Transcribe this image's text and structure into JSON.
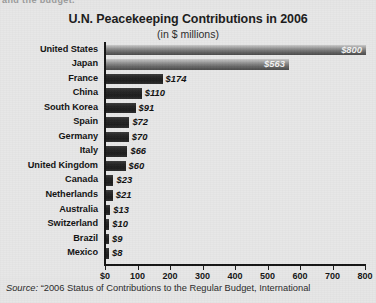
{
  "page": {
    "clipped_top_text": "and the budget."
  },
  "chart": {
    "title": "U.N. Peacekeeping Contributions in 2006",
    "subtitle": "(in $ millions)",
    "source_label": "Source:",
    "source_text": "“2006 Status of Contributions to the Regular Budget, International"
  },
  "chart_data": {
    "type": "bar",
    "orientation": "horizontal",
    "title": "U.N. Peacekeeping Contributions in 2006",
    "subtitle": "(in $ millions)",
    "xlabel": "",
    "ylabel": "",
    "xlim": [
      0,
      800
    ],
    "grid": false,
    "legend": null,
    "xticks": [
      0,
      100,
      200,
      300,
      400,
      500,
      600,
      700,
      800
    ],
    "xticklabels": [
      "$0",
      "100",
      "200",
      "300",
      "400",
      "500",
      "600",
      "700",
      "800"
    ],
    "categories": [
      "United States",
      "Japan",
      "France",
      "China",
      "South Korea",
      "Spain",
      "Germany",
      "Italy",
      "United Kingdom",
      "Canada",
      "Netherlands",
      "Australia",
      "Switzerland",
      "Brazil",
      "Mexico"
    ],
    "values": [
      800,
      563,
      174,
      110,
      91,
      72,
      70,
      66,
      60,
      23,
      21,
      13,
      10,
      9,
      8
    ],
    "value_labels": [
      "$800",
      "$563",
      "$174",
      "$110",
      "$91",
      "$72",
      "$70",
      "$66",
      "$60",
      "$23",
      "$21",
      "$13",
      "$10",
      "$9",
      "$8"
    ],
    "label_placement": [
      "inside",
      "inside",
      "outside",
      "outside",
      "outside",
      "outside",
      "outside",
      "outside",
      "outside",
      "outside",
      "outside",
      "outside",
      "outside",
      "outside",
      "outside"
    ],
    "bar_style": [
      "gradient",
      "gradient",
      "dark",
      "dark",
      "dark",
      "dark",
      "dark",
      "dark",
      "dark",
      "dark",
      "dark",
      "dark",
      "dark",
      "dark",
      "dark"
    ]
  },
  "colors": {
    "background": "#e6e6e6",
    "axis": "#151515",
    "bar_dark": "#262626",
    "bar_gradient_light": "#c9c9c9",
    "bar_gradient_dark": "#4c4c4c",
    "text": "#131313",
    "label_inside": "#f2f2f2"
  }
}
